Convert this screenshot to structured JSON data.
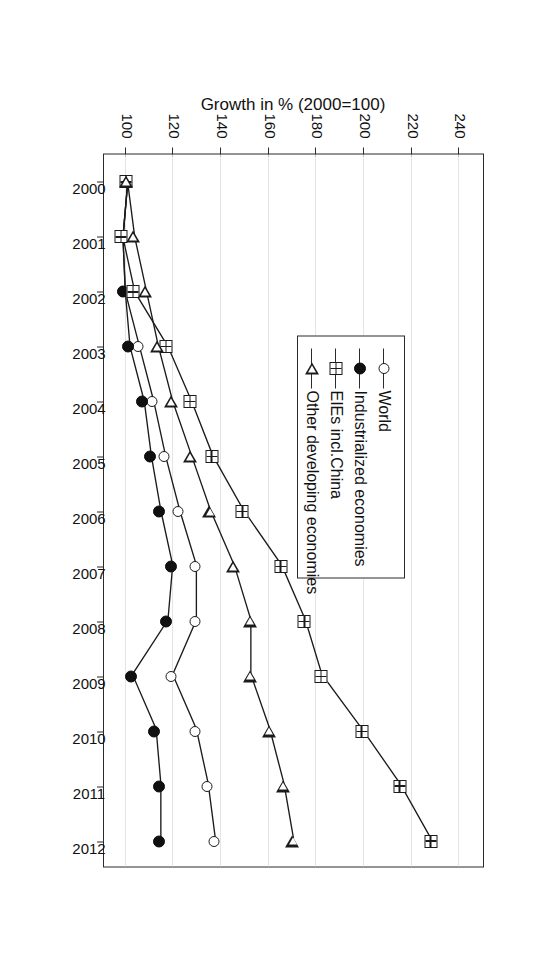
{
  "chart_data": {
    "type": "line",
    "title": "",
    "xlabel": "",
    "ylabel": "Growth in % (2000=100)",
    "orientation": "rotated-90-clockwise",
    "grid": true,
    "legend_position": "inside-upper-left",
    "xlim": [
      2000,
      2012
    ],
    "ylim": [
      90,
      250
    ],
    "yticks": [
      100,
      120,
      140,
      160,
      180,
      200,
      220,
      240
    ],
    "ytick_labels": [
      "100",
      "120",
      "140",
      "160",
      "180",
      "200",
      "220",
      "240"
    ],
    "x": [
      2000,
      2001,
      2002,
      2003,
      2004,
      2005,
      2006,
      2007,
      2008,
      2009,
      2010,
      2011,
      2012
    ],
    "xtick_labels": [
      "2000",
      "2001",
      "2002",
      "2003",
      "2004",
      "2005",
      "2006",
      "2007",
      "2008",
      "2009",
      "2010",
      "2011",
      "2012"
    ],
    "categories": [
      "2000",
      "2001",
      "2002",
      "2003",
      "2004",
      "2005",
      "2006",
      "2007",
      "2008",
      "2009",
      "2010",
      "2011",
      "2012"
    ],
    "series": [
      {
        "name": "World",
        "marker": "circle-open",
        "values": [
          100,
          98,
          99,
          105,
          111,
          116,
          122,
          129,
          129,
          119,
          129,
          134,
          137
        ]
      },
      {
        "name": "Industrialized economies",
        "marker": "circle-filled",
        "values": [
          100,
          98,
          99,
          101,
          107,
          110,
          114,
          119,
          117,
          102,
          112,
          114,
          114
        ]
      },
      {
        "name": "EIEs incl.China",
        "marker": "square-cross",
        "values": [
          100,
          98,
          103,
          117,
          127,
          136,
          149,
          165,
          175,
          182,
          199,
          215,
          228
        ]
      },
      {
        "name": "Other developing economies",
        "marker": "triangle-open",
        "values": [
          100,
          103,
          108,
          113,
          119,
          127,
          135,
          145,
          152,
          152,
          160,
          166,
          170
        ]
      }
    ]
  },
  "axis": {
    "y_title": "Growth in % (2000=100)"
  },
  "legend": {
    "items": [
      {
        "label": "World",
        "marker": "circle-open"
      },
      {
        "label": "Industrialized economies",
        "marker": "circle-filled"
      },
      {
        "label": "EIEs incl.China",
        "marker": "square-cross"
      },
      {
        "label": "Other developing economies",
        "marker": "triangle-open"
      }
    ]
  },
  "colors": {
    "line": "#1b1b1b",
    "grid": "#c9c9c9",
    "frame": "#2b2b2b",
    "background": "#ffffff"
  }
}
